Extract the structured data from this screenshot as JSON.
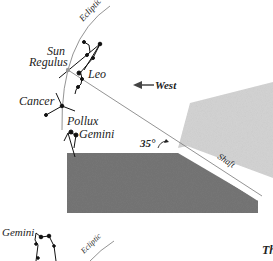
{
  "labels": {
    "ecliptic_top": "Ecliptic",
    "sun": "Sun",
    "regulus": "Regulus",
    "leo": "Leo",
    "west": "West",
    "cancer": "Cancer",
    "pollux": "Pollux",
    "gemini_upper": "Gemini",
    "angle": "35°",
    "shaft": "Shaft",
    "gemini_lower": "Gemini",
    "ecliptic_bottom": "Ecliptic",
    "cut_text": "Th"
  },
  "colors": {
    "dark_block": "#767676",
    "light_block": "#d4d4d4",
    "line": "#666666",
    "stars": "#111111"
  }
}
